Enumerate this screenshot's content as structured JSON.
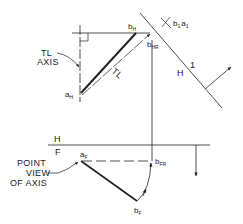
{
  "figure": {
    "colors": {
      "ink": "#222222",
      "background": "#ffffff"
    },
    "top_view": {
      "point_a": {
        "main": "a",
        "sub": "H"
      },
      "point_b": {
        "main": "b",
        "sub": "H"
      },
      "point_b_rotated": {
        "main": "b",
        "sub": "HR"
      },
      "tl_line_label": "TL",
      "callout_line1": "TL",
      "callout_line2": "AXIS"
    },
    "aux_view": {
      "point_label": {
        "main": "b",
        "sub": "1",
        "main2": "a",
        "sub2": "1"
      },
      "fold_left": "H",
      "fold_right": "1"
    },
    "front_view": {
      "fold_top": "H",
      "fold_bottom": "F",
      "point_a": {
        "main": "a",
        "sub": "F"
      },
      "point_b": {
        "main": "b",
        "sub": "F"
      },
      "point_b_rotated": {
        "main": "b",
        "sub": "FR"
      },
      "callout_line1": "POINT",
      "callout_line2": "VIEW",
      "callout_line3": "OF AXIS"
    }
  }
}
